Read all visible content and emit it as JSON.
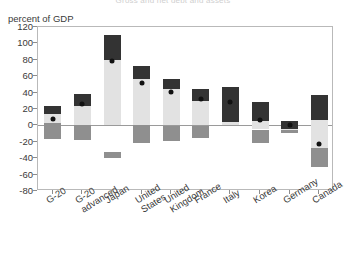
{
  "title_cutoff": "Gross and net debt and assets",
  "axis": {
    "unit_label": "percent of GDP",
    "y_ticks": [
      120,
      100,
      80,
      60,
      40,
      20,
      0,
      -20,
      -40,
      -60,
      -80
    ],
    "ylim": [
      -80,
      120
    ],
    "y_step": 20,
    "zero_line": 0
  },
  "colors": {
    "segment_dark": "#333333",
    "segment_light": "#e2e2e2",
    "segment_mid": "#8f8f8f",
    "marker": "#111111",
    "axis": "#b9b9b9",
    "zero_line": "#9a9a9a",
    "text": "#3a3a3a"
  },
  "chart_data": {
    "type": "bar",
    "title": "",
    "xlabel": "",
    "ylabel": "percent of GDP",
    "ylim": [
      -80,
      120
    ],
    "y_step": 20,
    "grid": false,
    "legend": "none",
    "stacked": true,
    "categories": [
      "G-20",
      "G-20 advanced",
      "Japan",
      "United States",
      "United Kingdom",
      "France",
      "Italy",
      "Korea",
      "Germany",
      "Canada"
    ],
    "series": [
      {
        "name": "upper dark segment (top)",
        "color": "#333333",
        "values": [
          24,
          38,
          110,
          72,
          57,
          45,
          47,
          28,
          5,
          37
        ]
      },
      {
        "name": "upper dark segment (bottom)",
        "color": "#333333",
        "values": [
          14,
          24,
          80,
          57,
          44,
          30,
          4,
          5,
          -4,
          6
        ]
      },
      {
        "name": "light segment (top)",
        "color": "#e2e2e2",
        "values": [
          14,
          24,
          80,
          57,
          44,
          30,
          4,
          5,
          -4,
          6
        ]
      },
      {
        "name": "light segment (bottom)",
        "color": "#e2e2e2",
        "values": [
          3,
          0,
          0,
          0,
          0,
          0,
          0,
          -5,
          -6,
          -28
        ]
      },
      {
        "name": "lower mid-gray segment (top)",
        "color": "#8f8f8f",
        "values": [
          3,
          0,
          -33,
          0,
          -1,
          -1,
          null,
          -5,
          -6,
          -28
        ]
      },
      {
        "name": "lower mid-gray segment (bottom)",
        "color": "#8f8f8f",
        "values": [
          -17,
          -18,
          -40,
          -21,
          -19,
          -15,
          null,
          -22,
          -9,
          -51
        ]
      }
    ],
    "markers": {
      "name": "net debt marker",
      "color": "#111111",
      "values": [
        8,
        26,
        78,
        52,
        41,
        32,
        28,
        7,
        0,
        -23
      ]
    }
  }
}
